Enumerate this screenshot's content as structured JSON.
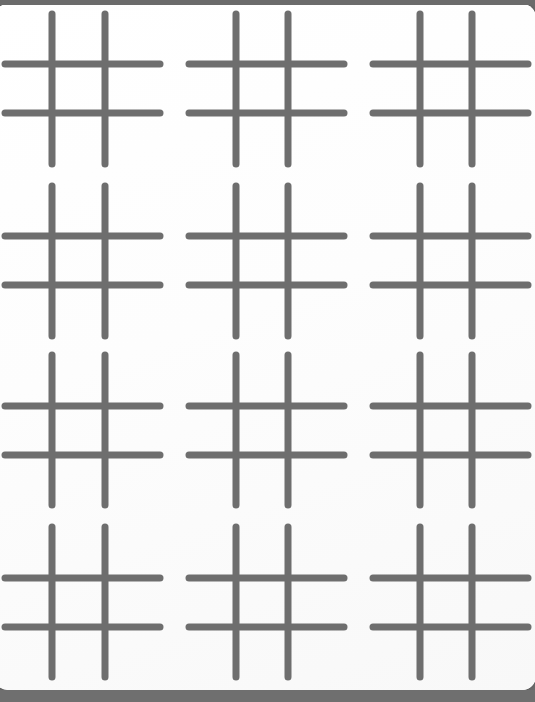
{
  "page": {
    "surface_label": "white paper sheet",
    "background_color": "#6b6b6b",
    "paper_color": "#fefefe",
    "width": 535,
    "height": 702,
    "paper_corner_radius": 14
  },
  "bars": {
    "top_label": "top background strip",
    "top_color": "#6b6b6b",
    "top_height": 5,
    "bottom_label": "bottom background strip",
    "bottom_color": "#6f6f6f",
    "bottom_y": 690,
    "bottom_height": 12
  },
  "grid": {
    "label": "tic-tac-toe grid sheet",
    "columns": 3,
    "rows": 4,
    "cell_count": 12,
    "stroke_color": "#6e6e6e",
    "stroke_width": 7,
    "stroke_linecap": "round",
    "column_vertical_x": [
      [
        52,
        105
      ],
      [
        236,
        288
      ],
      [
        420,
        472
      ]
    ],
    "row_horizontal_y": [
      [
        64,
        113
      ],
      [
        236,
        285
      ],
      [
        406,
        455
      ],
      [
        578,
        627
      ]
    ],
    "vertical_extent_y": [
      [
        14,
        164
      ],
      [
        186,
        336
      ],
      [
        355,
        505
      ],
      [
        527,
        677
      ]
    ],
    "horizontal_extent_x": [
      [
        5,
        160
      ],
      [
        189,
        344
      ],
      [
        373,
        528
      ]
    ],
    "cells": [
      {
        "row": 1,
        "col": 1,
        "name": "hash-r1c1",
        "value": ""
      },
      {
        "row": 1,
        "col": 2,
        "name": "hash-r1c2",
        "value": ""
      },
      {
        "row": 1,
        "col": 3,
        "name": "hash-r1c3",
        "value": ""
      },
      {
        "row": 2,
        "col": 1,
        "name": "hash-r2c1",
        "value": ""
      },
      {
        "row": 2,
        "col": 2,
        "name": "hash-r2c2",
        "value": ""
      },
      {
        "row": 2,
        "col": 3,
        "name": "hash-r2c3",
        "value": ""
      },
      {
        "row": 3,
        "col": 1,
        "name": "hash-r3c1",
        "value": ""
      },
      {
        "row": 3,
        "col": 2,
        "name": "hash-r3c2",
        "value": ""
      },
      {
        "row": 3,
        "col": 3,
        "name": "hash-r3c3",
        "value": ""
      },
      {
        "row": 4,
        "col": 1,
        "name": "hash-r4c1",
        "value": ""
      },
      {
        "row": 4,
        "col": 2,
        "name": "hash-r4c2",
        "value": ""
      },
      {
        "row": 4,
        "col": 3,
        "name": "hash-r4c3",
        "value": ""
      }
    ]
  }
}
